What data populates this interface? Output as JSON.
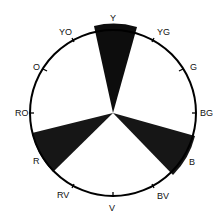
{
  "diagram": {
    "type": "color-wheel",
    "labels": [
      {
        "id": "Y",
        "text": "Y"
      },
      {
        "id": "YG",
        "text": "YG"
      },
      {
        "id": "G",
        "text": "G"
      },
      {
        "id": "BG",
        "text": "BG"
      },
      {
        "id": "B",
        "text": "B"
      },
      {
        "id": "BV",
        "text": "BV"
      },
      {
        "id": "V",
        "text": "V"
      },
      {
        "id": "RV",
        "text": "RV"
      },
      {
        "id": "R",
        "text": "R"
      },
      {
        "id": "RO",
        "text": "RO"
      },
      {
        "id": "O",
        "text": "O"
      },
      {
        "id": "YO",
        "text": "YO"
      }
    ],
    "shaded_wedges": [
      "Y",
      "B",
      "R"
    ],
    "colors": {
      "stroke": "#000000",
      "fill": "#111111",
      "background": "#ffffff"
    }
  }
}
